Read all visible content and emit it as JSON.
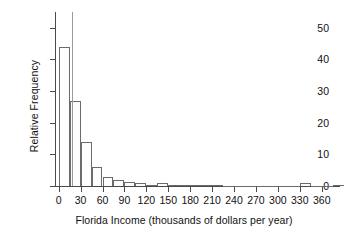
{
  "chart_data": {
    "type": "bar",
    "title": "",
    "subtitle": "",
    "xlabel": "Florida Income (thousands of dollars per year)",
    "ylabel": "Relative Frequency",
    "grid": false,
    "legend": "none",
    "xlim": [
      -5,
      385
    ],
    "ylim": [
      0,
      55
    ],
    "xticks": [
      0,
      30,
      60,
      90,
      120,
      150,
      180,
      210,
      240,
      270,
      300,
      330,
      360
    ],
    "xticklabels": [
      "0",
      "30",
      "60",
      "90",
      "120",
      "150",
      "180",
      "210",
      "240",
      "270",
      "300",
      "330",
      "360"
    ],
    "yticks": [
      0,
      10,
      20,
      30,
      40,
      50
    ],
    "yticklabels": [
      "0",
      "10",
      "20",
      "30",
      "40",
      "50"
    ],
    "bin_width": 15,
    "bin_starts": [
      0,
      15,
      30,
      45,
      60,
      75,
      90,
      105,
      120,
      135,
      150,
      165,
      180,
      195,
      210,
      225,
      240,
      255,
      270,
      285,
      300,
      315,
      330,
      345,
      360,
      375
    ],
    "categories": [
      "0-15",
      "15-30",
      "30-45",
      "45-60",
      "60-75",
      "75-90",
      "90-105",
      "105-120",
      "120-135",
      "135-150",
      "150-165",
      "165-180",
      "180-195",
      "195-210",
      "210-225",
      "225-240",
      "240-255",
      "255-270",
      "270-285",
      "285-300",
      "300-315",
      "315-330",
      "330-345",
      "345-360",
      "360-375",
      "375-390"
    ],
    "values": [
      44,
      27,
      14,
      6,
      3,
      2,
      1.3,
      0.8,
      0.4,
      0.9,
      0.3,
      0.2,
      0.2,
      0.2,
      0.2,
      0.1,
      0.1,
      0.1,
      0.1,
      0.1,
      0.1,
      0.1,
      0.9,
      0.1,
      0.1,
      0.4
    ],
    "colors": {
      "bar_fill": "#fdfdfd",
      "bar_edge": "#6b6b6b",
      "axis": "#4a4a4a",
      "text": "#111111",
      "background": "#ffffff",
      "stray_rule": "#9a9a9a"
    },
    "annotations": [
      {
        "name": "stray-vertical-rule",
        "x": 18,
        "y_top": 55,
        "y_bottom": 0
      }
    ]
  }
}
